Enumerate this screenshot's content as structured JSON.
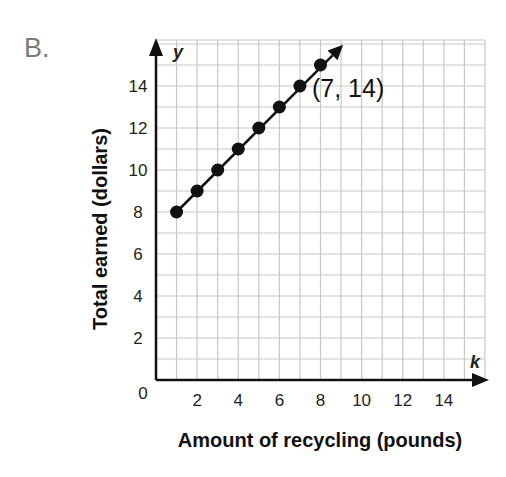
{
  "problem": {
    "label": "B."
  },
  "chart_data": {
    "type": "scatter",
    "title": "",
    "xlabel": "Amount of recycling (pounds)",
    "ylabel": "Total earned (dollars)",
    "x_axis_var": "k",
    "y_axis_var": "y",
    "xlim": [
      0,
      16
    ],
    "ylim": [
      0,
      16
    ],
    "xticks": [
      0,
      2,
      4,
      6,
      8,
      10,
      12,
      14
    ],
    "yticks": [
      2,
      4,
      6,
      8,
      10,
      12,
      14
    ],
    "grid": true,
    "points": [
      {
        "x": 1,
        "y": 8
      },
      {
        "x": 2,
        "y": 9
      },
      {
        "x": 3,
        "y": 10
      },
      {
        "x": 4,
        "y": 11
      },
      {
        "x": 5,
        "y": 12
      },
      {
        "x": 6,
        "y": 13
      },
      {
        "x": 7,
        "y": 14
      },
      {
        "x": 8,
        "y": 15
      }
    ],
    "line": {
      "from": {
        "x": 1,
        "y": 8
      },
      "to_arrow": {
        "x": 9.2,
        "y": 16.2
      }
    },
    "annotations": [
      {
        "text": "(7, 14)",
        "x": 7,
        "y": 14
      }
    ],
    "colors": {
      "grid": "#c8c8c8",
      "axis": "#111111",
      "points": "#111111"
    }
  },
  "labels": {
    "origin": "0",
    "x_var": "k",
    "y_var": "y",
    "annotation": "(7, 14)"
  }
}
